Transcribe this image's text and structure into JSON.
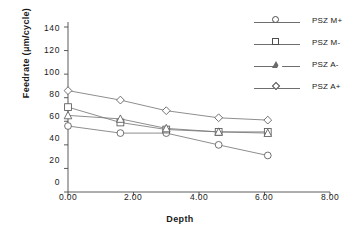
{
  "chart_data": {
    "type": "line",
    "title": "",
    "xlabel": "Depth",
    "ylabel": "Feedrate  (μm/cycle)",
    "xlim": [
      0,
      8
    ],
    "ylim": [
      0,
      140
    ],
    "xticks": [
      "0.00",
      "2.00",
      "4.00",
      "6.00",
      "8.00"
    ],
    "yticks": [
      "0",
      "20",
      "40",
      "60",
      "80",
      "100",
      "120",
      "140"
    ],
    "grid": false,
    "legend_position": "top-right",
    "x": [
      0.0,
      1.6,
      3.0,
      4.6,
      6.1
    ],
    "series": [
      {
        "name": "PSZ M+",
        "marker": "circle",
        "values": [
          56,
          50,
          50,
          40,
          31
        ]
      },
      {
        "name": "PSZ M-",
        "marker": "square",
        "values": [
          72,
          59,
          53,
          51,
          51
        ]
      },
      {
        "name": "PSZ A-",
        "marker": "triangle",
        "values": [
          65,
          62,
          54,
          51,
          50
        ]
      },
      {
        "name": "PSZ A+",
        "marker": "diamond",
        "values": [
          86,
          78,
          69,
          63,
          61
        ]
      }
    ]
  },
  "axes": {
    "x_title": "Depth",
    "y_title": "Feedrate  (μm/cycle)",
    "x_tick_labels": [
      "0.00",
      "2.00",
      "4.00",
      "6.00",
      "8.00"
    ],
    "y_tick_labels": [
      "140",
      "120",
      "100",
      "80",
      "60",
      "40",
      "20",
      "0"
    ]
  },
  "legend": {
    "items": [
      {
        "label": "PSZ M+",
        "marker": "circle-marker-icon"
      },
      {
        "label": "PSZ M-",
        "marker": "square-marker-icon"
      },
      {
        "label": "PSZ A-",
        "marker": "triangle-marker-icon"
      },
      {
        "label": "PSZ A+",
        "marker": "diamond-marker-icon"
      }
    ]
  }
}
